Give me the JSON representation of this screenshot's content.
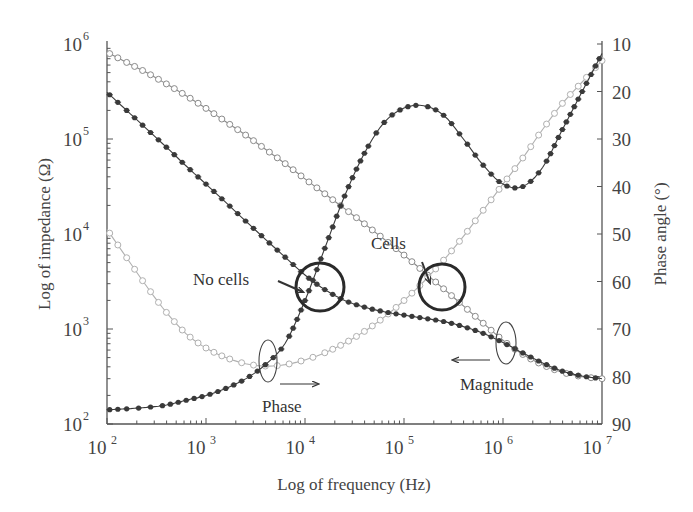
{
  "chart_data": {
    "type": "line",
    "title": "",
    "xlabel": "Log of frequency (Hz)",
    "ylabel": "Log of impedance (Ω)",
    "y2label": "Phase angle (°)",
    "xscale": "log",
    "yscale": "log",
    "xlim": [
      100,
      10000000
    ],
    "ylim": [
      100,
      1000000
    ],
    "y2lim": [
      90,
      10
    ],
    "y2_inverted": true,
    "grid": false,
    "legend": null,
    "x_ticks": [
      {
        "value": 100,
        "base": "10",
        "exp": "2"
      },
      {
        "value": 1000,
        "base": "10",
        "exp": "3"
      },
      {
        "value": 10000,
        "base": "10",
        "exp": "4"
      },
      {
        "value": 100000,
        "base": "10",
        "exp": "5"
      },
      {
        "value": 1000000,
        "base": "10",
        "exp": "6"
      },
      {
        "value": 10000000,
        "base": "10",
        "exp": "7"
      }
    ],
    "y_ticks": [
      {
        "value": 100,
        "base": "10",
        "exp": "2"
      },
      {
        "value": 1000,
        "base": "10",
        "exp": "3"
      },
      {
        "value": 10000,
        "base": "10",
        "exp": "4"
      },
      {
        "value": 100000,
        "base": "10",
        "exp": "5"
      },
      {
        "value": 1000000,
        "base": "10",
        "exp": "6"
      }
    ],
    "y2_ticks": [
      "10",
      "20",
      "30",
      "40",
      "50",
      "60",
      "70",
      "80",
      "90"
    ],
    "x": [
      100,
      158,
      251,
      398,
      631,
      1000,
      1585,
      2512,
      3981,
      6310,
      10000,
      15849,
      25119,
      39811,
      63096,
      100000,
      158489,
      251189,
      398107,
      630957,
      1000000,
      1584893,
      2511886,
      3981072,
      6309573,
      10000000
    ],
    "series": [
      {
        "name": "No cells magnitude",
        "axis": "left",
        "marker": "filled",
        "color": "#3a3a3a",
        "values": [
          310000,
          200000,
          128000,
          82000,
          52000,
          33500,
          21500,
          13700,
          8800,
          5700,
          3700,
          2600,
          2000,
          1700,
          1520,
          1400,
          1300,
          1200,
          1060,
          900,
          720,
          560,
          440,
          360,
          320,
          300
        ]
      },
      {
        "name": "Cells magnitude",
        "axis": "left",
        "marker": "hollow",
        "color": "#8a8a8a",
        "values": [
          820000,
          640000,
          500000,
          380000,
          285000,
          210000,
          152000,
          110000,
          78000,
          55000,
          38000,
          26500,
          18500,
          12800,
          8800,
          6000,
          4000,
          2650,
          1750,
          1150,
          760,
          540,
          420,
          350,
          315,
          300
        ]
      },
      {
        "name": "No cells phase",
        "axis": "right",
        "marker": "filled",
        "color": "#3a3a3a",
        "values": [
          87,
          86.8,
          86.5,
          86,
          85,
          84,
          82.5,
          80.5,
          77.5,
          73,
          64,
          53,
          42,
          33,
          26.5,
          23.5,
          23,
          25,
          30,
          35.5,
          39.5,
          40,
          36,
          28,
          20,
          12
        ]
      },
      {
        "name": "Cells phase",
        "axis": "right",
        "marker": "hollow",
        "color": "#b0b0b0",
        "values": [
          49,
          55,
          61,
          66.5,
          71,
          74,
          76,
          77.3,
          77.8,
          77.5,
          76.5,
          75,
          73,
          70.5,
          67.5,
          64,
          60,
          55.5,
          50.5,
          45,
          39.5,
          34,
          28,
          22.5,
          18,
          13.5
        ]
      }
    ],
    "annotations": [
      {
        "text": "No cells",
        "x": 193,
        "y": 285,
        "circle": {
          "cx": 320,
          "cy": 287,
          "r": 24
        },
        "arrow": {
          "x1": 278,
          "y1": 281,
          "x2": 303,
          "y2": 292
        }
      },
      {
        "text": "Cells",
        "x": 371,
        "y": 249,
        "circle": {
          "cx": 442,
          "cy": 287,
          "r": 23
        },
        "arrow": {
          "x1": 422,
          "y1": 262,
          "x2": 430,
          "y2": 283
        }
      },
      {
        "text": "Phase",
        "x": 262,
        "y": 412,
        "ellipse": {
          "cx": 268,
          "cy": 361,
          "rx": 9,
          "ry": 21
        },
        "arrow": {
          "x1": 280,
          "y1": 384,
          "x2": 318,
          "y2": 384
        }
      },
      {
        "text": "Magnitude",
        "x": 460,
        "y": 390,
        "ellipse": {
          "cx": 506,
          "cy": 343,
          "rx": 10,
          "ry": 21
        },
        "arrow": {
          "x1": 490,
          "y1": 360,
          "x2": 453,
          "y2": 360
        }
      }
    ]
  }
}
